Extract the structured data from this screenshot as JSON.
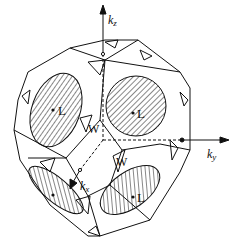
{
  "diagram": {
    "type": "brillouin-zone-fermi-surface",
    "axes": {
      "kz": {
        "label": "k",
        "sub": "z"
      },
      "ky": {
        "label": "k",
        "sub": "y"
      },
      "kx": {
        "label": "k",
        "sub": "x"
      }
    },
    "points": {
      "L_upper_left": "L",
      "L_upper_right": "L",
      "L_lower_right": "L",
      "W_center": "W",
      "W_lower": "W"
    },
    "colors": {
      "line": "#111111",
      "background": "#ffffff"
    }
  }
}
